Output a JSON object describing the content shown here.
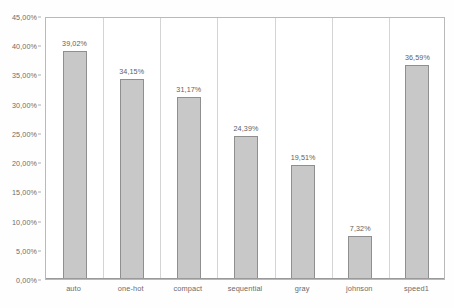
{
  "chart_data": {
    "type": "bar",
    "title": "",
    "xlabel": "",
    "ylabel": "",
    "categories": [
      "auto",
      "one-hot",
      "compact",
      "sequential",
      "gray",
      "johnson",
      "speed1"
    ],
    "values": [
      39.02,
      34.15,
      31.17,
      24.39,
      19.51,
      7.32,
      36.59
    ],
    "value_labels": [
      "39,02%",
      "34,15%",
      "31,17%",
      "24,39%",
      "19,51%",
      "7,32%",
      "36,59%"
    ],
    "ylim": [
      0,
      45
    ],
    "ytick_values": [
      0,
      5,
      10,
      15,
      20,
      25,
      30,
      35,
      40,
      45
    ],
    "ytick_labels": [
      "0,00%",
      "5,00%",
      "10,00%",
      "15,00%",
      "20,00%",
      "25,00%",
      "30,00%",
      "35,00%",
      "40,00%",
      "45,00%"
    ],
    "grid": false,
    "legend": null,
    "legend_position": "none",
    "decimal_separator": ",",
    "colors": {
      "bar_fill": "#c8c8c8",
      "bar_border": "#8f8f8f",
      "plot_border": "#b9b9b9",
      "separator": "#d4d4d4",
      "text": "#6b6b6b",
      "background": "#ffffff"
    }
  }
}
